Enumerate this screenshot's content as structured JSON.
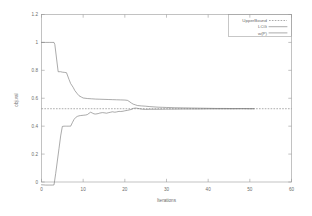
{
  "chart_data": {
    "type": "line",
    "title": "",
    "xlabel": "Iterations",
    "ylabel": "obj.val",
    "xlim": [
      0,
      60
    ],
    "ylim": [
      0,
      1.2
    ],
    "xticks": [
      "0",
      "10",
      "20",
      "30",
      "40",
      "50",
      "60"
    ],
    "xtick_values": [
      0,
      10,
      20,
      30,
      40,
      50,
      60
    ],
    "yticks": [
      "0",
      "0.2",
      "0.4",
      "0.6",
      "0.8",
      "1",
      "1.2"
    ],
    "ytick_values": [
      0,
      0.2,
      0.4,
      0.6,
      0.8,
      1,
      1.2
    ],
    "grid": false,
    "legend_position": "top-right",
    "legend": [
      "UpperBound",
      "LCG",
      "w(P)"
    ],
    "series": [
      {
        "name": "UpperBound",
        "style": "dashed",
        "x": [
          0,
          60
        ],
        "values": [
          0.525,
          0.525
        ]
      },
      {
        "name": "LCG",
        "style": "solid",
        "x": [
          0,
          1,
          2,
          3,
          3.2,
          4,
          4.6,
          5,
          5.6,
          6,
          6.6,
          7,
          7.6,
          8,
          8.6,
          9,
          9.6,
          10,
          11,
          12,
          13,
          14,
          15,
          16,
          17,
          18,
          19,
          20,
          20.6,
          21,
          21.6,
          22,
          22.6,
          23,
          24,
          25,
          26,
          27,
          28,
          29,
          30,
          32,
          34,
          36,
          38,
          40,
          42,
          44,
          46,
          48,
          50,
          51
        ],
        "values": [
          1.0,
          1.0,
          1.0,
          1.0,
          0.985,
          0.79,
          0.79,
          0.787,
          0.785,
          0.783,
          0.735,
          0.705,
          0.678,
          0.655,
          0.632,
          0.618,
          0.608,
          0.602,
          0.598,
          0.596,
          0.594,
          0.593,
          0.592,
          0.591,
          0.59,
          0.589,
          0.588,
          0.587,
          0.585,
          0.578,
          0.565,
          0.558,
          0.552,
          0.548,
          0.545,
          0.543,
          0.54,
          0.538,
          0.536,
          0.535,
          0.534,
          0.532,
          0.531,
          0.53,
          0.529,
          0.528,
          0.527,
          0.527,
          0.526,
          0.526,
          0.525,
          0.525
        ]
      },
      {
        "name": "w(P)",
        "style": "solid",
        "x": [
          0,
          0.6,
          1,
          1.6,
          2,
          2.6,
          3,
          3.4,
          3.8,
          4.2,
          4.6,
          5,
          5.4,
          5.8,
          6,
          6.4,
          6.8,
          7,
          7.4,
          7.8,
          8.2,
          8.6,
          9,
          9.4,
          10,
          10.6,
          11,
          11.4,
          11.8,
          12.2,
          12.6,
          13,
          13.6,
          14,
          14.6,
          15,
          15.6,
          16,
          16.6,
          17,
          17.6,
          18,
          18.6,
          19,
          19.6,
          20,
          20.6,
          21,
          21.6,
          22,
          22.6,
          23,
          24,
          25,
          26,
          27,
          28,
          30,
          32,
          34,
          36,
          38,
          40,
          42,
          45,
          48,
          51
        ],
        "values": [
          -0.02,
          -0.021,
          -0.022,
          -0.022,
          -0.022,
          -0.022,
          -0.021,
          0.06,
          0.15,
          0.24,
          0.33,
          0.398,
          0.4,
          0.4,
          0.4,
          0.4,
          0.4,
          0.4,
          0.425,
          0.448,
          0.462,
          0.47,
          0.474,
          0.476,
          0.478,
          0.48,
          0.483,
          0.492,
          0.5,
          0.494,
          0.488,
          0.487,
          0.49,
          0.494,
          0.497,
          0.496,
          0.493,
          0.496,
          0.5,
          0.503,
          0.5,
          0.502,
          0.506,
          0.505,
          0.507,
          0.51,
          0.513,
          0.516,
          0.52,
          0.527,
          0.53,
          0.528,
          0.522,
          0.52,
          0.521,
          0.521,
          0.521,
          0.522,
          0.522,
          0.523,
          0.523,
          0.523,
          0.524,
          0.524,
          0.524,
          0.525,
          0.525
        ]
      }
    ]
  }
}
